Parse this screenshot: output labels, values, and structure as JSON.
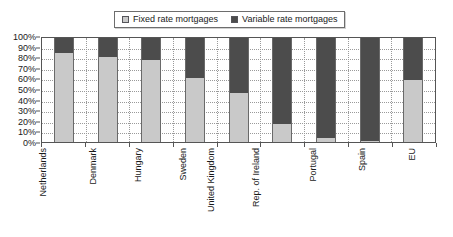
{
  "chart_data": {
    "type": "bar",
    "subtype": "stacked-100-percent",
    "title": "",
    "xlabel": "",
    "ylabel": "",
    "ylim": [
      0,
      100
    ],
    "ytick_labels": [
      "100%",
      "90%",
      "80%",
      "70%",
      "60%",
      "50%",
      "40%",
      "30%",
      "20%",
      "10%",
      "0%"
    ],
    "ytick_values": [
      100,
      90,
      80,
      70,
      60,
      50,
      40,
      30,
      20,
      10,
      0
    ],
    "grid": "horizontal-dotted-and-vertical-dotted",
    "legend_position": "top-center",
    "categories": [
      "Netherlands",
      "Denmark",
      "Hungary",
      "Sweden",
      "United Kingdom",
      "Rep. of Ireland",
      "Portugal",
      "Spain",
      "EU"
    ],
    "series": [
      {
        "name": "Fixed rate mortgages",
        "color": "#c9c9c9",
        "values": [
          86,
          82,
          79,
          62,
          47,
          17,
          4,
          1,
          60
        ]
      },
      {
        "name": "Variable rate mortgages",
        "color": "#4c4c4c",
        "values": [
          14,
          18,
          21,
          38,
          53,
          83,
          96,
          99,
          40
        ]
      }
    ]
  },
  "legend": {
    "entries": [
      {
        "label": "Fixed rate mortgages",
        "color": "#c9c9c9"
      },
      {
        "label": "Variable rate mortgages",
        "color": "#4c4c4c"
      }
    ]
  },
  "colors": {
    "fixed": "#c9c9c9",
    "variable": "#4c4c4c",
    "axis": "#555555",
    "grid": "#9a9a9a",
    "background": "#ffffff"
  }
}
